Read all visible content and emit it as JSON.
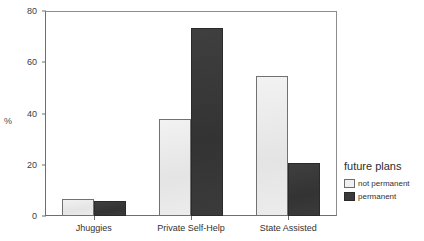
{
  "chart_data": {
    "type": "bar",
    "title": "",
    "subtitle": "",
    "xlabel": "",
    "ylabel": "%",
    "ylim": [
      0,
      80
    ],
    "yticks": [
      0,
      20,
      40,
      60,
      80
    ],
    "ytick_labels": [
      "0",
      "20",
      "40",
      "60",
      "80"
    ],
    "grid": false,
    "legend_position": "right",
    "legend_title": "future plans",
    "categories": [
      "Jhuggies",
      "Private Self-Help",
      "State Assisted"
    ],
    "series": [
      {
        "name": "not permanent",
        "color": "#ececec",
        "edge_color": "#717171",
        "values": [
          6.5,
          38,
          54.5
        ]
      },
      {
        "name": "permanent",
        "color": "#3a3a3a",
        "edge_color": "#2a2a2a",
        "values": [
          6,
          73.5,
          20.5
        ]
      }
    ]
  },
  "axes": {
    "y_label": "%",
    "y_ticks": [
      "80",
      "60",
      "40",
      "20",
      "0"
    ]
  },
  "legend": {
    "title": "future plans",
    "items": [
      {
        "label": "not permanent",
        "swatch": "light"
      },
      {
        "label": "permanent",
        "swatch": "dark"
      }
    ]
  },
  "x_axis": {
    "labels": [
      "Jhuggies",
      "Private Self-Help",
      "State Assisted"
    ]
  }
}
